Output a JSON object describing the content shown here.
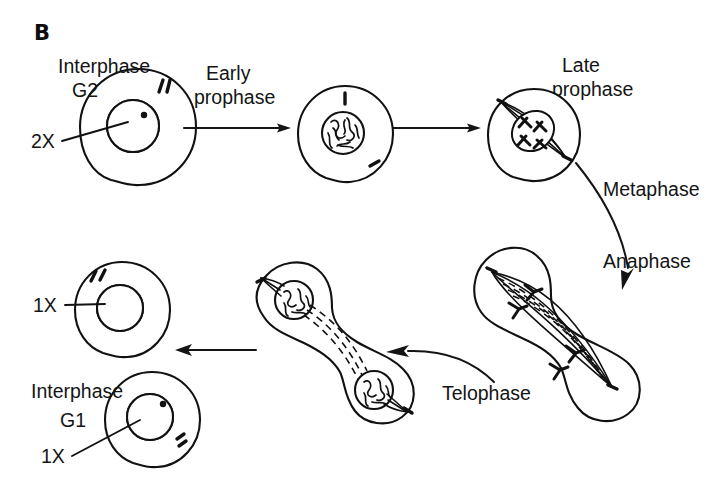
{
  "figure": {
    "panel_letter": "B",
    "background_color": "#ffffff",
    "ink_color": "#111111",
    "width": 714,
    "height": 480
  },
  "labels": {
    "interphase_g2": "Interphase",
    "interphase_g2_sub": "G2",
    "ploidy_2x": "2X",
    "early_prophase_line1": "Early",
    "early_prophase_line2": "prophase",
    "late_prophase_line1": "Late",
    "late_prophase_line2": "prophase",
    "metaphase": "Metaphase",
    "anaphase": "Anaphase",
    "telophase": "Telophase",
    "ploidy_1x_top": "1X",
    "interphase_g1": "Interphase",
    "interphase_g1_sub": "G1",
    "ploidy_1x_bottom": "1X"
  },
  "stages": [
    {
      "id": "interphase-g2",
      "name": "Interphase G2",
      "label": "Interphase",
      "sublabel": "G2",
      "ploidy": "2X",
      "description": "Round cell with hatched round nucleus and paired centriole marks at upper right",
      "cell_center": [
        138,
        127
      ],
      "cell_radius": 58,
      "nucleus_center": [
        133,
        126
      ],
      "nucleus_radius": 26
    },
    {
      "id": "early-prophase",
      "name": "Early prophase",
      "label": "Early prophase",
      "description": "Round cell with condensing tangled chromatin nucleus; centriole marks at top and lower right",
      "cell_center": [
        345,
        133
      ],
      "cell_radius": 48,
      "nucleus_center": [
        343,
        133
      ],
      "nucleus_radius": 21
    },
    {
      "id": "late-prophase",
      "name": "Late prophase",
      "label": "Late prophase",
      "description": "Round cell with spindle forming between two poles, chromosomes at center",
      "cell_center": [
        534,
        135
      ],
      "cell_radius": 46
    },
    {
      "id": "metaphase",
      "name": "Metaphase",
      "label": "Metaphase",
      "description": "Transition label on curved arrow leaving late prophase"
    },
    {
      "id": "anaphase",
      "name": "Anaphase",
      "label": "Anaphase",
      "description": "Large elongated dumbbell cell with spindle fibers and chromosomes separating toward opposite poles",
      "cell_center": [
        570,
        335
      ]
    },
    {
      "id": "telophase",
      "name": "Telophase",
      "label": "Telophase",
      "description": "Dumbbell-shaped dividing cell with two reforming nuclei connected by dashed spindle remnants",
      "cell_center": [
        350,
        345
      ]
    },
    {
      "id": "daughter-cell-top",
      "name": "Daughter cell 1X",
      "ploidy": "1X",
      "description": "Round cell with hatched nucleus and centriole marks at upper left",
      "cell_center": [
        122,
        310
      ],
      "cell_radius": 48,
      "nucleus_center": [
        120,
        308
      ],
      "nucleus_radius": 23
    },
    {
      "id": "interphase-g1",
      "name": "Interphase G1",
      "label": "Interphase",
      "sublabel": "G1",
      "ploidy": "1X",
      "description": "Round cell with hatched nucleus and centriole marks at lower right",
      "cell_center": [
        152,
        420
      ],
      "cell_radius": 48,
      "nucleus_center": [
        150,
        417
      ],
      "nucleus_radius": 23
    }
  ],
  "arrows": [
    {
      "id": "arrow-g2-to-early-prophase",
      "type": "straight",
      "direction": "right",
      "from_stage": "interphase-g2",
      "to_stage": "early-prophase"
    },
    {
      "id": "arrow-early-to-late-prophase",
      "type": "straight",
      "direction": "right",
      "from_stage": "early-prophase",
      "to_stage": "late-prophase"
    },
    {
      "id": "arrow-metaphase-anaphase",
      "type": "curved",
      "direction": "down",
      "from_stage": "late-prophase",
      "to_stage": "anaphase",
      "labels": [
        "Metaphase",
        "Anaphase"
      ]
    },
    {
      "id": "arrow-telophase",
      "type": "curved",
      "direction": "left",
      "from_stage": "anaphase",
      "to_stage": "telophase",
      "label": "Telophase"
    },
    {
      "id": "arrow-telophase-to-daughter",
      "type": "straight",
      "direction": "left",
      "from_stage": "telophase",
      "to_stage": "daughter-cell-top"
    }
  ]
}
